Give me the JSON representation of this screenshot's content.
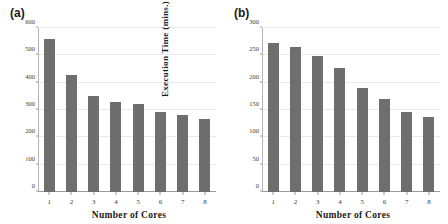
{
  "figure": {
    "background": "#ffffff",
    "bar_color": "#6e6e6e",
    "grid_color": "#e9e9e9",
    "axis_color": "#9a9a9a"
  },
  "panels": [
    {
      "label": "(a)",
      "chart_data": {
        "type": "bar",
        "title": "",
        "xlabel": "Number of Cores",
        "ylabel": "Execution Time (s)",
        "categories": [
          "1",
          "2",
          "3",
          "4",
          "5",
          "6",
          "7",
          "8"
        ],
        "values": [
          560,
          428,
          352,
          328,
          323,
          291,
          283,
          268
        ],
        "ylim": [
          0,
          600
        ],
        "yticks": [
          0,
          100,
          200,
          300,
          400,
          500,
          600
        ],
        "ytick_labels": [
          "0",
          "100",
          "200",
          "300",
          "400",
          "500",
          "600"
        ],
        "grid": true,
        "legend": false
      }
    },
    {
      "label": "(b)",
      "chart_data": {
        "type": "bar",
        "title": "",
        "xlabel": "Number of Cores",
        "ylabel": "Execution Time (mins.)",
        "categories": [
          "1",
          "2",
          "3",
          "4",
          "5",
          "6",
          "7",
          "8"
        ],
        "values": [
          272,
          265,
          249,
          227,
          191,
          170,
          147,
          137
        ],
        "ylim": [
          0,
          300
        ],
        "yticks": [
          0,
          50,
          100,
          150,
          200,
          250,
          300
        ],
        "ytick_labels": [
          "0",
          "50",
          "100",
          "150",
          "200",
          "250",
          "300"
        ],
        "grid": true,
        "legend": false
      }
    }
  ]
}
